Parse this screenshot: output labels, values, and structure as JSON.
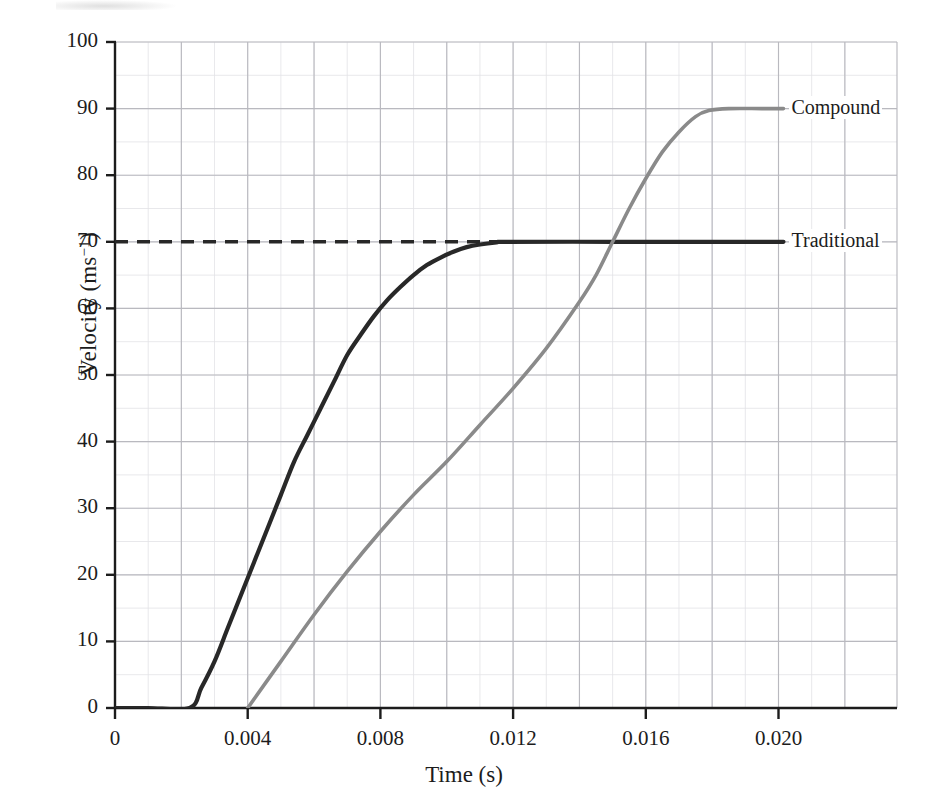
{
  "chart_data": {
    "type": "line",
    "title": "",
    "xlabel": "Time (s)",
    "ylabel_html": "Velocity (ms<sup>−1</sup>)",
    "ylabel_plain": "Velocity (ms⁻¹)",
    "xlim": [
      0,
      0.0226
    ],
    "ylim": [
      0,
      100
    ],
    "xticks": [
      0,
      0.004,
      0.008,
      0.012,
      0.016,
      0.02
    ],
    "xtick_labels": [
      "0",
      "0.004",
      "0.008",
      "0.012",
      "0.016",
      "0.020"
    ],
    "yticks": [
      0,
      10,
      20,
      30,
      40,
      50,
      60,
      70,
      80,
      90,
      100
    ],
    "ytick_labels": [
      "0",
      "10",
      "20",
      "30",
      "40",
      "50",
      "60",
      "70",
      "80",
      "90",
      "100"
    ],
    "grid": true,
    "grid_major_x_step": 0.002,
    "grid_major_y_step": 10,
    "legend_position": "right-of-line-end",
    "colors": {
      "traditional": "#282828",
      "compound": "#8a8a8a",
      "grid": "#b9b9bf",
      "minor_grid": "#e2e2e6",
      "axis": "#1c1c1c",
      "dashed_guide": "#282828"
    },
    "annotations": [
      {
        "name": "dashed-guide-70",
        "type": "dashed-horizontal",
        "y": 70,
        "x_from": 0,
        "x_to": 0.01185,
        "label": ""
      }
    ],
    "series": [
      {
        "name": "Traditional",
        "label": "Traditional",
        "color": "#282828",
        "plateau_value": 70,
        "start_time": 0.00225,
        "plateau_time": 0.01185,
        "end_time": 0.02015,
        "points": [
          [
            0.0,
            0
          ],
          [
            0.001,
            0
          ],
          [
            0.00225,
            0
          ],
          [
            0.0026,
            3
          ],
          [
            0.003,
            7
          ],
          [
            0.0034,
            12
          ],
          [
            0.0038,
            17
          ],
          [
            0.0042,
            22
          ],
          [
            0.0046,
            27
          ],
          [
            0.005,
            32
          ],
          [
            0.0054,
            37
          ],
          [
            0.0058,
            41
          ],
          [
            0.0062,
            45
          ],
          [
            0.0066,
            49
          ],
          [
            0.007,
            53
          ],
          [
            0.0074,
            56
          ],
          [
            0.0078,
            58.8
          ],
          [
            0.0082,
            61.2
          ],
          [
            0.0086,
            63.2
          ],
          [
            0.009,
            65
          ],
          [
            0.0094,
            66.5
          ],
          [
            0.0098,
            67.6
          ],
          [
            0.0102,
            68.5
          ],
          [
            0.0106,
            69.2
          ],
          [
            0.011,
            69.6
          ],
          [
            0.0115,
            69.9
          ],
          [
            0.01185,
            70
          ],
          [
            0.015,
            70
          ],
          [
            0.018,
            70
          ],
          [
            0.02015,
            70
          ]
        ]
      },
      {
        "name": "Compound",
        "label": "Compound",
        "color": "#8a8a8a",
        "plateau_value": 90,
        "start_time": 0.004,
        "plateau_time": 0.0179,
        "end_time": 0.02015,
        "points": [
          [
            0.004,
            0
          ],
          [
            0.005,
            7
          ],
          [
            0.006,
            14
          ],
          [
            0.007,
            20.5
          ],
          [
            0.008,
            26.5
          ],
          [
            0.009,
            32
          ],
          [
            0.01,
            37
          ],
          [
            0.011,
            42.5
          ],
          [
            0.012,
            48
          ],
          [
            0.013,
            54
          ],
          [
            0.014,
            61
          ],
          [
            0.0145,
            65
          ],
          [
            0.015,
            70
          ],
          [
            0.0155,
            75
          ],
          [
            0.016,
            79.5
          ],
          [
            0.0165,
            83.5
          ],
          [
            0.017,
            86.5
          ],
          [
            0.0175,
            88.8
          ],
          [
            0.0179,
            89.7
          ],
          [
            0.0185,
            90
          ],
          [
            0.0195,
            90
          ],
          [
            0.02015,
            90
          ]
        ]
      }
    ]
  }
}
